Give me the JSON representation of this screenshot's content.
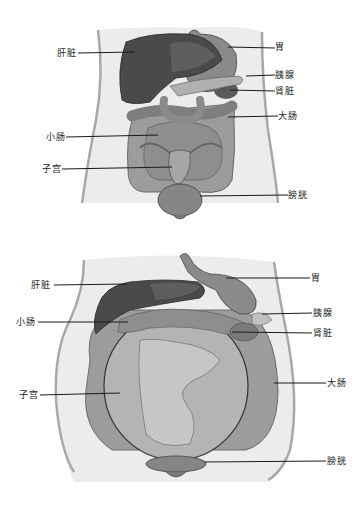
{
  "caption": "",
  "colors": {
    "body_fill": "#ececec",
    "body_outline": "#a8a8a8",
    "liver": "#4a4a4a",
    "liver_light": "#5e5e5e",
    "stomach": "#8a8a8a",
    "intestine": "#9c9c9c",
    "intestine_dark": "#7e7e7e",
    "uterus": "#a6a6a6",
    "bladder": "#858585",
    "leader_line": "#1a1a1a",
    "label_text": "#222222"
  },
  "figures": [
    {
      "id": "non-pregnant",
      "labels": {
        "liver": "肝脏",
        "stomach": "胃",
        "pancreas": "胰腺",
        "kidney": "肾脏",
        "large_intestine": "大肠",
        "small_intestine": "小肠",
        "uterus": "子宫",
        "bladder": "膀胱"
      }
    },
    {
      "id": "pregnant",
      "labels": {
        "liver": "肝脏",
        "stomach": "胃",
        "pancreas": "胰腺",
        "kidney": "肾脏",
        "large_intestine": "大肠",
        "small_intestine": "小肠",
        "uterus": "子宫",
        "bladder": "膀胱"
      }
    }
  ]
}
